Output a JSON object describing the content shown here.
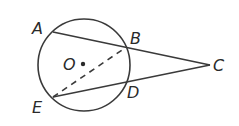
{
  "diagram": {
    "type": "geometry",
    "colors": {
      "stroke": "#3a3a3a",
      "label": "#2a2a2a",
      "background": "#ffffff"
    },
    "circle": {
      "center_label": "O",
      "cx": 84,
      "cy": 65,
      "r": 46
    },
    "points": [
      {
        "id": "A",
        "label": "A",
        "x": 53,
        "y": 32,
        "label_x": 32,
        "label_y": 34
      },
      {
        "id": "B",
        "label": "B",
        "x": 125,
        "y": 48,
        "label_x": 130,
        "label_y": 44
      },
      {
        "id": "C",
        "label": "C",
        "x": 210,
        "y": 65,
        "label_x": 213,
        "label_y": 71
      },
      {
        "id": "D",
        "label": "D",
        "x": 127,
        "y": 80,
        "label_x": 127,
        "label_y": 98
      },
      {
        "id": "E",
        "label": "E",
        "x": 53,
        "y": 97,
        "label_x": 32,
        "label_y": 113
      },
      {
        "id": "O",
        "label": "O",
        "x": 83,
        "y": 64,
        "label_x": 63,
        "label_y": 70
      }
    ],
    "segments": [
      {
        "from": "A",
        "to": "C",
        "style": "solid"
      },
      {
        "from": "E",
        "to": "C",
        "style": "solid"
      },
      {
        "from": "E",
        "to": "B",
        "style": "dashed"
      }
    ]
  }
}
